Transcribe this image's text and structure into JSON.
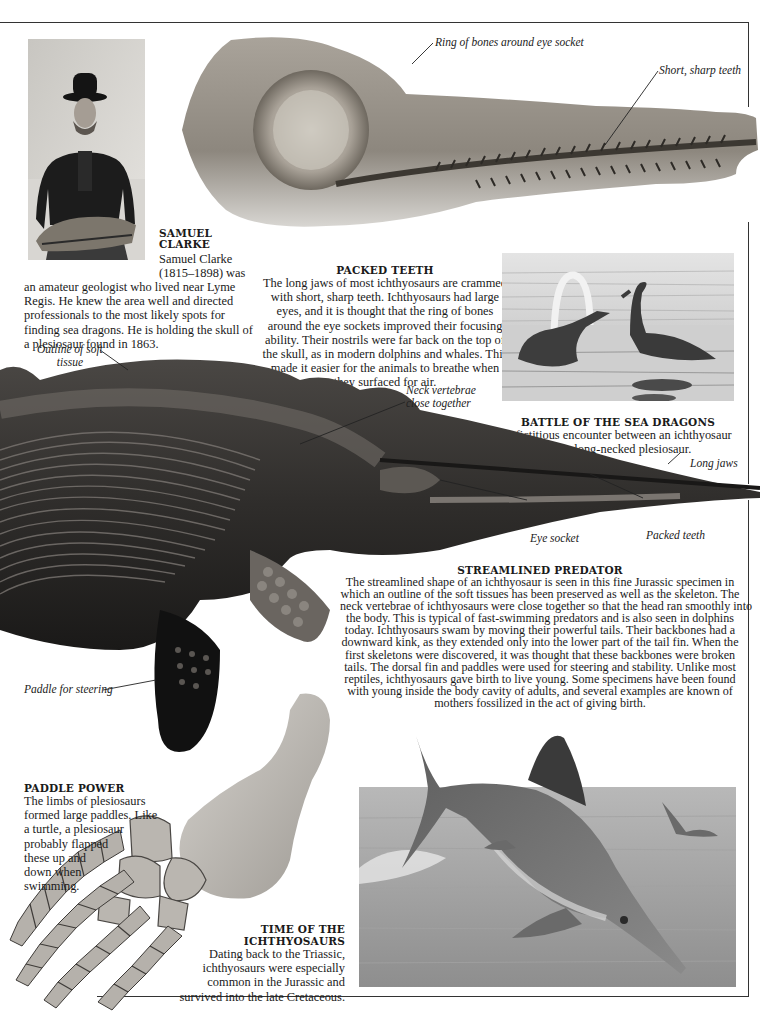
{
  "page": {
    "frame_color": "#333333",
    "background": "#ffffff"
  },
  "samuel_clarke": {
    "image_alt": "Photograph of Samuel Clarke holding a plesiosaur skull",
    "title_line1": "SAMUEL",
    "title_line2": "CLARKE",
    "text_side_1": "Samuel Clarke",
    "text_side_2": "(1815–1898) was",
    "text_body": "an amateur geologist who lived near Lyme Regis. He knew the area well and directed professionals to the most likely spots for finding sea dragons. He is holding the skull of a plesiosaur found in 1863."
  },
  "skull_fossil": {
    "image_alt": "Ichthyosaur skull fossil",
    "labels": {
      "ring_of_bones": "Ring of bones around eye socket",
      "short_sharp_teeth": "Short, sharp teeth"
    }
  },
  "packed_teeth": {
    "title": "PACKED TEETH",
    "text": "The long jaws of most ichthyosaurs are crammed with short, sharp teeth. Ichthyosaurs had large eyes, and it is thought that the ring of bones around the eye sockets improved their focusing ability. Their nostrils were far back on the top of the skull, as in modern dolphins and whales. This made it easier for the animals to breathe when they surfaced for air."
  },
  "battle": {
    "image_alt": "Engraving of an ichthyosaur fighting a long-necked plesiosaur",
    "title": "BATTLE OF THE SEA DRAGONS",
    "text": "A fictitious encounter between an ichthyosaur and a long-necked plesiosaur."
  },
  "ichthyosaur_fossil": {
    "image_alt": "Jurassic ichthyosaur fossil with preserved soft tissue outline",
    "labels": {
      "outline_soft_tissue_1": "Outline of soft",
      "outline_soft_tissue_2": "tissue",
      "neck_vertebrae_1": "Neck vertebrae",
      "neck_vertebrae_2": "close together",
      "long_jaws": "Long jaws",
      "eye_socket": "Eye socket",
      "packed_teeth": "Packed teeth",
      "paddle_for_steering": "Paddle for steering"
    }
  },
  "streamlined": {
    "title": "STREAMLINED PREDATOR",
    "lines": [
      "The streamlined shape of an ichthyosaur is seen in this fine Jurassic specimen in",
      "which an outline of the soft tissues has been preserved as well as the skeleton. The",
      "neck vertebrae of ichthyosaurs were close together so that the head ran smoothly into",
      "the body. This is typical of fast-swimming predators and is also seen in dolphins",
      "today. Ichthyosaurs swam by moving their powerful tails. Their backbones had a",
      "downward kink, as they extended only into the lower part of the tail fin. When the",
      "first skeletons were discovered, it was thought that these backbones were broken",
      "tails. The dorsal fin and paddles were used for steering and stability. Unlike most",
      "reptiles, ichthyosaurs gave birth to live young. Some specimens have been found",
      "with young inside the body cavity of adults, and several examples are known of",
      "mothers fossilized in the act of giving birth."
    ]
  },
  "paddle_power": {
    "title": "PADDLE POWER",
    "lines": [
      "The limbs of plesiosaurs",
      "formed large paddles. Like",
      "a turtle, a plesiosaur",
      "probably flapped",
      "these up and",
      "down when",
      "swimming."
    ],
    "image_alt": "Plesiosaur paddle bones"
  },
  "time_of": {
    "title_line1": "TIME OF THE",
    "title_line2": "ICHTHYOSAURS",
    "lines": [
      "Dating back to the Triassic,",
      "ichthyosaurs were especially",
      "common in the Jurassic and",
      "survived into the late Cretaceous."
    ]
  },
  "painting": {
    "image_alt": "Painting of ichthyosaurs leaping from the sea"
  }
}
